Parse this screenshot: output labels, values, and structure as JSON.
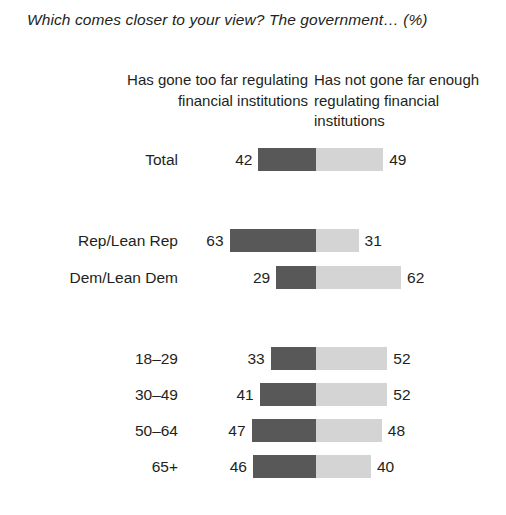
{
  "title": "Which comes closer to your view? The government… (%)",
  "headers": {
    "left": "Has gone too far regulating financial institutions",
    "right": "Has not gone far enough regulating financial institutions"
  },
  "chart_data": {
    "type": "bar",
    "title": "Which comes closer to your view? The government… (%)",
    "subtitle": "",
    "xlabel": "",
    "ylabel": "",
    "orientation": "horizontal",
    "layout": "diverging-stacked",
    "grid": false,
    "legend_position": "top",
    "categories": [
      "Total",
      "Rep/Lean Rep",
      "Dem/Lean Dem",
      "18–29",
      "30–49",
      "50–64",
      "65+"
    ],
    "series": [
      {
        "name": "Has gone too far regulating financial institutions",
        "color": "#585858",
        "values": [
          42,
          63,
          29,
          33,
          41,
          47,
          46
        ]
      },
      {
        "name": "Has not gone far enough regulating financial institutions",
        "color": "#d4d4d4",
        "values": [
          49,
          31,
          62,
          52,
          52,
          48,
          40
        ]
      }
    ],
    "groups": [
      {
        "name": "overall",
        "categories": [
          "Total"
        ]
      },
      {
        "name": "party",
        "categories": [
          "Rep/Lean Rep",
          "Dem/Lean Dem"
        ]
      },
      {
        "name": "age",
        "categories": [
          "18–29",
          "30–49",
          "50–64",
          "65+"
        ]
      }
    ],
    "rows": [
      {
        "label": "Total",
        "left": 42,
        "right": 49,
        "y": 148,
        "group": "overall"
      },
      {
        "label": "Rep/Lean Rep",
        "left": 63,
        "right": 31,
        "y": 229,
        "group": "party"
      },
      {
        "label": "Dem/Lean Dem",
        "left": 29,
        "right": 62,
        "y": 266,
        "group": "party"
      },
      {
        "label": "18–29",
        "left": 33,
        "right": 52,
        "y": 347,
        "group": "age"
      },
      {
        "label": "30–49",
        "left": 41,
        "right": 52,
        "y": 383,
        "group": "age"
      },
      {
        "label": "50–64",
        "left": 47,
        "right": 48,
        "y": 419,
        "group": "age"
      },
      {
        "label": "65+",
        "left": 46,
        "right": 40,
        "y": 455,
        "group": "age"
      }
    ]
  },
  "colors": {
    "left_segment": "#585858",
    "right_segment": "#d4d4d4",
    "text": "#231f20",
    "background": "#ffffff"
  }
}
